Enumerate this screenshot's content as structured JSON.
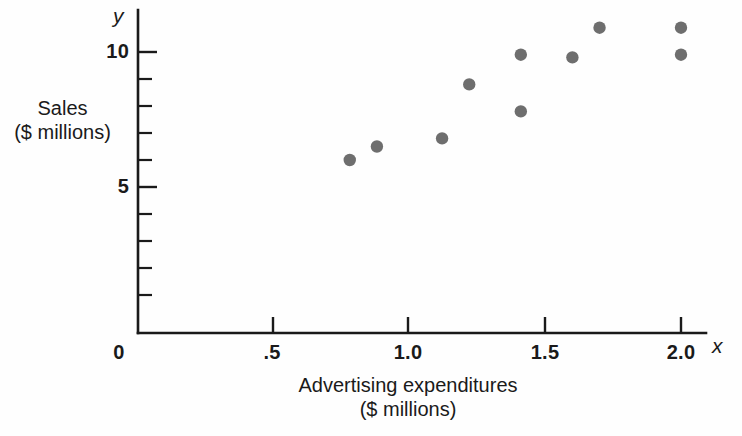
{
  "chart_data": {
    "type": "scatter",
    "title": "",
    "xlabel": "Advertising expenditures ($ millions)",
    "ylabel": "Sales ($ millions)",
    "xlim": [
      0,
      2.15
    ],
    "ylim": [
      0,
      11.4
    ],
    "grid": false,
    "legend": null,
    "x": [
      0.78,
      0.88,
      1.12,
      1.22,
      1.41,
      1.41,
      1.6,
      1.7,
      2.0,
      2.0
    ],
    "y": [
      6.0,
      6.5,
      6.8,
      8.8,
      9.9,
      7.8,
      9.8,
      10.9,
      10.9,
      9.9
    ],
    "points": [
      {
        "x": 0.78,
        "y": 6.0
      },
      {
        "x": 0.88,
        "y": 6.5
      },
      {
        "x": 1.12,
        "y": 6.8
      },
      {
        "x": 1.22,
        "y": 8.8
      },
      {
        "x": 1.41,
        "y": 9.9
      },
      {
        "x": 1.41,
        "y": 7.8
      },
      {
        "x": 1.6,
        "y": 9.8
      },
      {
        "x": 1.7,
        "y": 10.9
      },
      {
        "x": 2.0,
        "y": 10.9
      },
      {
        "x": 2.0,
        "y": 9.9
      }
    ],
    "marker_color": "#6e6e6e",
    "axis_color": "#1a1a1a",
    "background_color": "#fefefe",
    "x_ticks": [
      {
        "value": 0,
        "label": "0"
      },
      {
        "value": 0.5,
        "label": ".5"
      },
      {
        "value": 1.0,
        "label": "1.0"
      },
      {
        "value": 1.5,
        "label": "1.5"
      },
      {
        "value": 2.0,
        "label": "2.0"
      }
    ],
    "y_ticks": [
      {
        "value": 1,
        "label": ""
      },
      {
        "value": 2,
        "label": ""
      },
      {
        "value": 3,
        "label": ""
      },
      {
        "value": 4,
        "label": ""
      },
      {
        "value": 5,
        "label": "5"
      },
      {
        "value": 6,
        "label": ""
      },
      {
        "value": 7,
        "label": ""
      },
      {
        "value": 8,
        "label": ""
      },
      {
        "value": 9,
        "label": ""
      },
      {
        "value": 10,
        "label": "10"
      }
    ]
  },
  "labels": {
    "y_axis_variable": "y",
    "x_axis_variable": "x",
    "y_axis_title_line1": "Sales",
    "y_axis_title_line2": "($ millions)",
    "x_axis_title_line1": "Advertising expenditures",
    "x_axis_title_line2": "($ millions)",
    "origin_label": "0",
    "x_tick_1": ".5",
    "x_tick_2": "1.0",
    "x_tick_3": "1.5",
    "x_tick_4": "2.0",
    "y_tick_5": "5",
    "y_tick_10": "10"
  }
}
